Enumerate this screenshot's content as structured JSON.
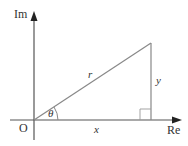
{
  "diagram": {
    "axes": {
      "horizontal_label": "Re",
      "vertical_label": "Im",
      "origin_label": "O"
    },
    "triangle": {
      "hypotenuse_label": "r",
      "adjacent_label": "x",
      "opposite_label": "y",
      "angle_label": "θ",
      "right_angle_marker": true
    },
    "colors": {
      "line": "#888888",
      "axis": "#555555",
      "text": "#333333",
      "background": "#ffffff"
    }
  }
}
